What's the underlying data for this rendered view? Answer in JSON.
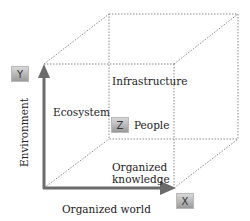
{
  "diagram": {
    "type": "3d-cube",
    "axes": {
      "x": {
        "box": "X",
        "label": "Organized world"
      },
      "y": {
        "box": "Y",
        "label": "Environment"
      },
      "z": {
        "box": "Z",
        "label": "People"
      }
    },
    "regions": {
      "ecosystem": "Ecosystem",
      "infrastructure": "Infrastructure",
      "organized_knowledge_line1": "Organized",
      "organized_knowledge_line2": "knowledge"
    },
    "colors": {
      "axis": "#6b6b6b",
      "dotted": "#8a8a8a",
      "box_top": "#d8d8d8",
      "box_bottom": "#9a9a9a"
    }
  }
}
